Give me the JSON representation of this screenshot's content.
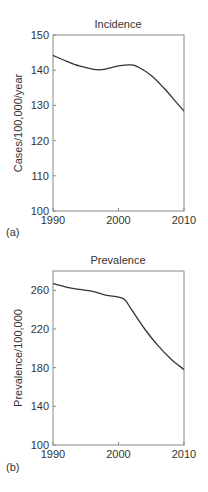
{
  "chart_data": [
    {
      "type": "line",
      "panel_label": "(a)",
      "title": "Incidence",
      "xlabel": "",
      "ylabel": "Cases/100,000/year",
      "xlim": [
        1990,
        2010
      ],
      "ylim": [
        100,
        150
      ],
      "x_ticks": [
        "1990",
        "2000",
        "2010"
      ],
      "y_ticks": [
        "100",
        "110",
        "120",
        "130",
        "140",
        "150"
      ],
      "grid": false,
      "series": [
        {
          "name": "Incidence",
          "x": [
            1990,
            1992,
            1994,
            1996,
            1997,
            1998,
            2000,
            2002,
            2003,
            2005,
            2007,
            2009,
            2010
          ],
          "values": [
            144.2,
            142.6,
            141.2,
            140.3,
            140.1,
            140.3,
            141.2,
            141.5,
            140.9,
            138.5,
            134.8,
            130.5,
            128.4
          ]
        }
      ]
    },
    {
      "type": "line",
      "panel_label": "(b)",
      "title": "Prevalence",
      "xlabel": "",
      "ylabel": "Prevalence/100,000",
      "xlim": [
        1990,
        2010
      ],
      "ylim": [
        100,
        280
      ],
      "x_ticks": [
        "1990",
        "2000",
        "2010"
      ],
      "y_ticks": [
        "100",
        "140",
        "180",
        "220",
        "260"
      ],
      "grid": false,
      "series": [
        {
          "name": "Prevalence",
          "x": [
            1990,
            1993,
            1996,
            1998,
            2000,
            2001,
            2002,
            2004,
            2006,
            2008,
            2010
          ],
          "values": [
            267,
            262,
            259,
            255,
            253,
            250,
            240,
            220,
            203,
            189,
            178
          ]
        }
      ]
    }
  ]
}
